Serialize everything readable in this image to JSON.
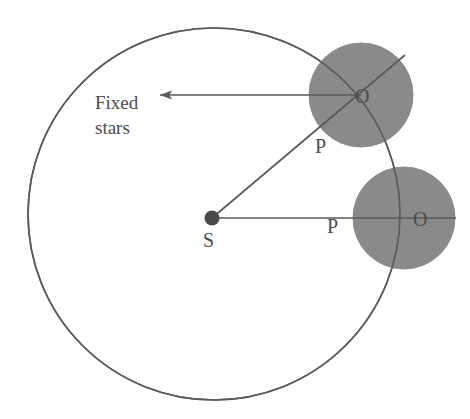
{
  "figure": {
    "kind": "geometry-diagram",
    "background_color": "#ffffff",
    "stroke_color": "#595959",
    "shade_color": "#8a8a8a",
    "label_color": "#4c4c4c"
  },
  "labels": {
    "fixed_stars_line1": "Fixed",
    "fixed_stars_line2": "stars",
    "sun_center": "S",
    "orbit_point_upper": "P",
    "orbit_point_lower": "P",
    "body_center_upper": "O",
    "body_center_lower": "O"
  },
  "geometry": {
    "orbit_circle": {
      "cx": 214,
      "cy": 214,
      "r": 186
    },
    "body_upper": {
      "cx": 361,
      "cy": 95,
      "r": 52
    },
    "body_lower": {
      "cx": 404,
      "cy": 218,
      "r": 51
    },
    "sun_dot": {
      "cx": 212,
      "cy": 218,
      "r": 7
    },
    "arrow": {
      "x1": 361,
      "y1": 95,
      "x2": 153,
      "y2": 95,
      "direction": "left"
    },
    "radius_upper": {
      "x1": 212,
      "y1": 218,
      "x2": 405,
      "y2": 55
    },
    "radius_lower": {
      "x1": 212,
      "y1": 218,
      "x2": 455,
      "y2": 218
    }
  },
  "label_positions": {
    "fixed_stars": {
      "x": 95,
      "y": 109
    },
    "sun_center": {
      "x": 203,
      "y": 247
    },
    "orbit_point_upper": {
      "x": 315,
      "y": 153
    },
    "orbit_point_lower": {
      "x": 327,
      "y": 233
    },
    "body_center_upper": {
      "x": 355,
      "y": 103
    },
    "body_center_lower": {
      "x": 413,
      "y": 226
    }
  }
}
